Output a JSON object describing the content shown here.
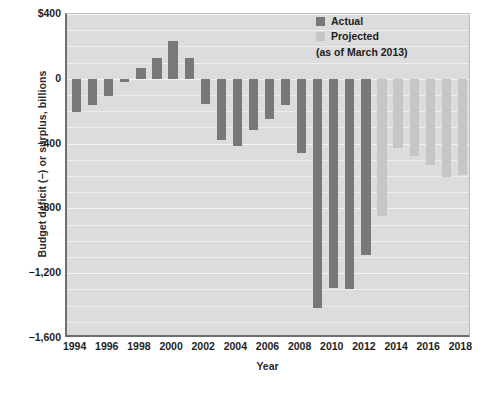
{
  "chart_data": {
    "type": "bar",
    "title": "",
    "xlabel": "Year",
    "ylabel": "Budget deficit (−) or surplus, billions",
    "ylim": [
      -1600,
      400
    ],
    "xlim": [
      1993.4,
      2018.6
    ],
    "grid": true,
    "grid_step": 100,
    "y_ticks": [
      {
        "value": 400,
        "label": "$400"
      },
      {
        "value": 0,
        "label": "0"
      },
      {
        "value": -400,
        "label": "−400"
      },
      {
        "value": -800,
        "label": "−800"
      },
      {
        "value": -1200,
        "label": "−1,200"
      },
      {
        "value": -1600,
        "label": "−1,600"
      }
    ],
    "x_ticks": [
      {
        "value": 1994,
        "label": "1994"
      },
      {
        "value": 1996,
        "label": "1996"
      },
      {
        "value": 1998,
        "label": "1998"
      },
      {
        "value": 2000,
        "label": "2000"
      },
      {
        "value": 2002,
        "label": "2002"
      },
      {
        "value": 2004,
        "label": "2004"
      },
      {
        "value": 2006,
        "label": "2006"
      },
      {
        "value": 2008,
        "label": "2008"
      },
      {
        "value": 2010,
        "label": "2010"
      },
      {
        "value": 2012,
        "label": "2012"
      },
      {
        "value": 2014,
        "label": "2014"
      },
      {
        "value": 2016,
        "label": "2016"
      },
      {
        "value": 2018,
        "label": "2018"
      }
    ],
    "legend": {
      "position": "top-right",
      "entries": [
        {
          "name": "Actual",
          "color": "#787878"
        },
        {
          "name": "Projected",
          "color": "#c6c6c6"
        }
      ],
      "note": "(as of March 2013)"
    },
    "categories": [
      1994,
      1995,
      1996,
      1997,
      1998,
      1999,
      2000,
      2001,
      2002,
      2003,
      2004,
      2005,
      2006,
      2007,
      2008,
      2009,
      2010,
      2011,
      2012,
      2013,
      2014,
      2015,
      2016,
      2017,
      2018
    ],
    "values": [
      -203,
      -164,
      -107,
      -22,
      69,
      126,
      236,
      128,
      -158,
      -378,
      -413,
      -318,
      -248,
      -161,
      -459,
      -1413,
      -1294,
      -1300,
      -1087,
      -845,
      -430,
      -476,
      -535,
      -605,
      -595
    ],
    "series": [
      {
        "name": "Actual",
        "color": "#787878",
        "x": [
          1994,
          1995,
          1996,
          1997,
          1998,
          1999,
          2000,
          2001,
          2002,
          2003,
          2004,
          2005,
          2006,
          2007,
          2008,
          2009,
          2010,
          2011,
          2012
        ],
        "values": [
          -203,
          -164,
          -107,
          -22,
          69,
          126,
          236,
          128,
          -158,
          -378,
          -413,
          -318,
          -248,
          -161,
          -459,
          -1413,
          -1294,
          -1300,
          -1087
        ]
      },
      {
        "name": "Projected",
        "color": "#c6c6c6",
        "x": [
          2013,
          2014,
          2015,
          2016,
          2017,
          2018
        ],
        "values": [
          -845,
          -430,
          -476,
          -535,
          -605,
          -595
        ]
      }
    ]
  },
  "axes": {
    "y_title": "Budget deficit (−) or surplus, billions",
    "x_title": "Year"
  },
  "legend": {
    "actual_label": "Actual",
    "projected_label": "Projected",
    "note": "(as of March 2013)"
  }
}
